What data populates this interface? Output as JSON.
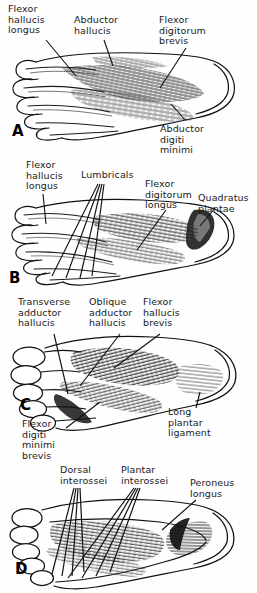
{
  "figure": {
    "background_color": "#fefefe",
    "ink_color": "#1a1a1a",
    "width": 257,
    "height": 593
  },
  "panels": [
    {
      "letter": "A",
      "name": "first-layer",
      "labels": [
        {
          "text": "Flexor\nhallucis\nlongus",
          "x": 8,
          "y": 4
        },
        {
          "text": "Abductor\nhallucis",
          "x": 74,
          "y": 15
        },
        {
          "text": "Flexor\ndigitorum\nbrevis",
          "x": 159,
          "y": 15
        },
        {
          "text": "Abductor\ndigiti\nminimi",
          "x": 160,
          "y": 124
        }
      ]
    },
    {
      "letter": "B",
      "name": "second-layer",
      "labels": [
        {
          "text": "Flexor\nhallucis\nlongus",
          "x": 26,
          "y": 8
        },
        {
          "text": "Lumbricals",
          "x": 81,
          "y": 18
        },
        {
          "text": "Flexor\ndigitorum\nlongus",
          "x": 145,
          "y": 27
        },
        {
          "text": "Quadratus\nplantae",
          "x": 198,
          "y": 41
        }
      ]
    },
    {
      "letter": "C",
      "name": "third-layer",
      "labels": [
        {
          "text": "Transverse\nadductor\nhallucis",
          "x": 18,
          "y": 9
        },
        {
          "text": "Oblique\nadductor\nhallucis",
          "x": 89,
          "y": 9
        },
        {
          "text": "Flexor\nhallucis\nbrevis",
          "x": 143,
          "y": 9
        },
        {
          "text": "Flexor\ndigiti\nminimi\nbrevis",
          "x": 22,
          "y": 131
        },
        {
          "text": "Long\nplantar\nligament",
          "x": 168,
          "y": 119
        }
      ]
    },
    {
      "letter": "D",
      "name": "fourth-layer",
      "labels": [
        {
          "text": "Dorsal\ninterossei",
          "x": 60,
          "y": 5
        },
        {
          "text": "Plantar\ninterossei",
          "x": 121,
          "y": 5
        },
        {
          "text": "Peroneus\nlongus",
          "x": 190,
          "y": 18
        }
      ]
    }
  ],
  "panel_letters": {
    "a": {
      "text": "A",
      "x": 12,
      "y": 122
    },
    "b": {
      "text": "B",
      "x": 9,
      "y": 117
    },
    "c": {
      "text": "C",
      "x": 20,
      "y": 108
    },
    "d": {
      "text": "D",
      "x": 15,
      "y": 100
    }
  }
}
